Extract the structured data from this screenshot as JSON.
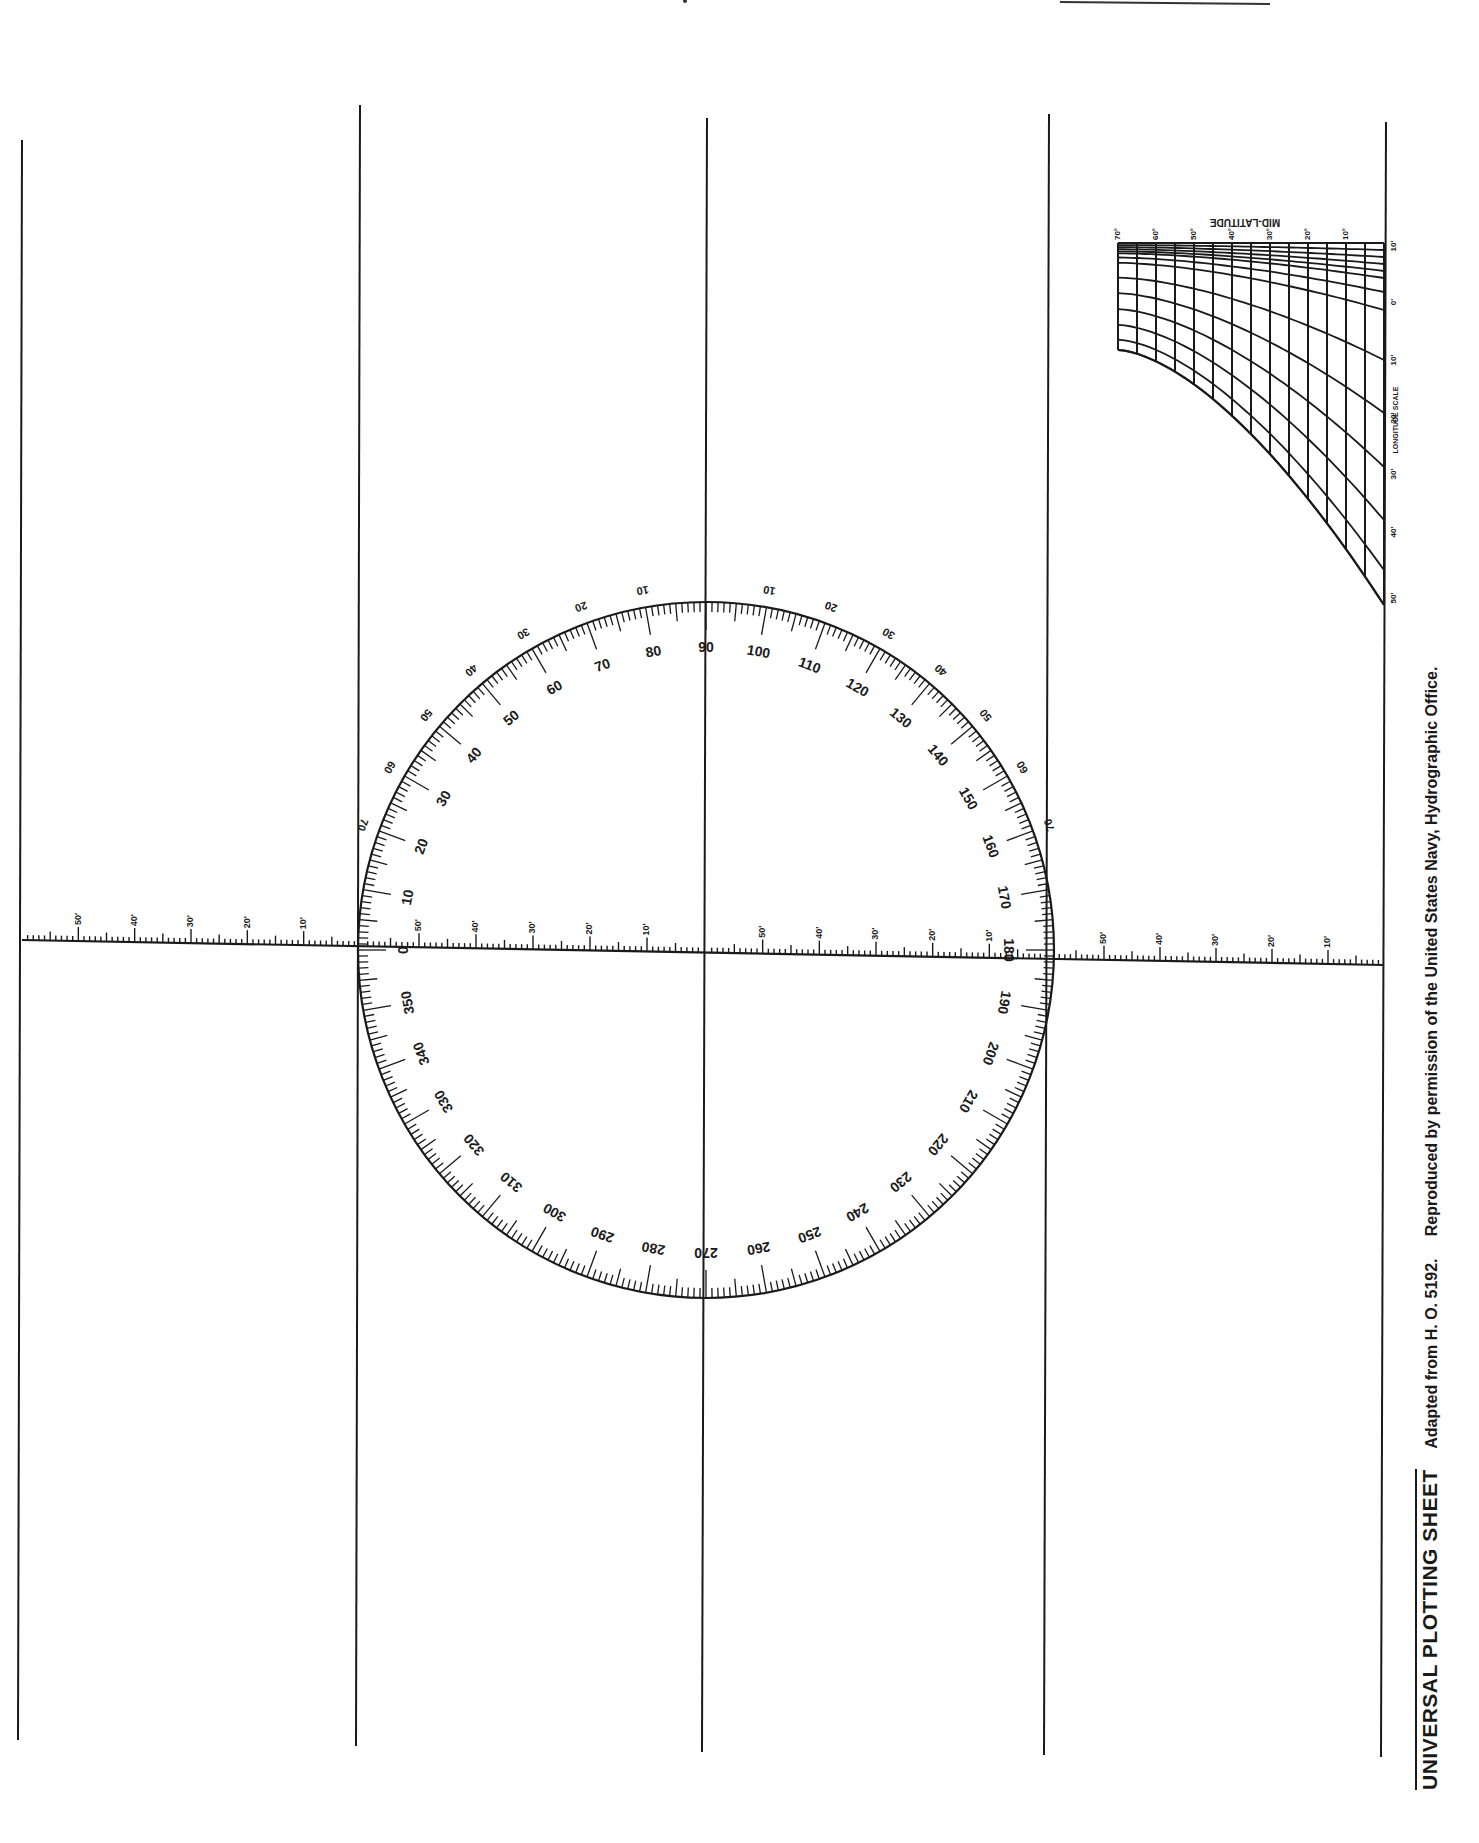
{
  "document": {
    "title": "UNIVERSAL PLOTTING SHEET",
    "credit_1": "Adapted from H. O. 5192.",
    "credit_2": "Reproduced by permission of the United States Navy, Hydrographic Office.",
    "orientation": "rotated 90 degrees counter-clockwise"
  },
  "colors": {
    "ink": "#1a1a1a",
    "paper": "#ffffff"
  },
  "meridians": [
    {
      "x1": 22,
      "y1": 140,
      "x2": 18,
      "y2": 1740
    },
    {
      "x1": 360,
      "y1": 105,
      "x2": 356,
      "y2": 1746
    },
    {
      "x1": 707,
      "y1": 118,
      "x2": 702,
      "y2": 1752
    },
    {
      "x1": 1049,
      "y1": 114,
      "x2": 1044,
      "y2": 1755
    },
    {
      "x1": 1386,
      "y1": 122,
      "x2": 1381,
      "y2": 1757
    }
  ],
  "centerline": {
    "x1": 22,
    "y1": 940,
    "x2": 1384,
    "y2": 965
  },
  "compass_rose": {
    "cx": 706,
    "cy": 950,
    "r": 348,
    "outer_labels": [
      "10",
      "20",
      "30",
      "40",
      "50",
      "60",
      "70",
      "80",
      "90",
      "100",
      "110",
      "120",
      "130",
      "140",
      "150",
      "160",
      "170",
      "180",
      "190",
      "200",
      "210",
      "220",
      "230",
      "240",
      "250",
      "260",
      "270",
      "280",
      "290",
      "300",
      "310",
      "320",
      "330",
      "340",
      "350",
      "0"
    ],
    "inner_angle_labels_upper_left": [
      "10",
      "20",
      "30",
      "40",
      "50",
      "60",
      "70"
    ],
    "inner_angle_labels_upper_right": [
      "10",
      "20",
      "30",
      "40",
      "50",
      "60",
      "70"
    ]
  },
  "centerline_scale": {
    "left_segment_labels": [
      "50'",
      "40'",
      "30'",
      "20'",
      "10'"
    ],
    "inner_left_labels": [
      "50'",
      "40'",
      "30'",
      "20'",
      "10'"
    ],
    "inner_right_labels": [
      "50'",
      "40'",
      "30'",
      "20'",
      "10'"
    ],
    "right_segment_labels": [
      "50'",
      "40'",
      "30'",
      "20'",
      "10'"
    ]
  },
  "mid_latitude_scale": {
    "title": "MID-LATITUDE",
    "axis_label": "LONGITUDE SCALE",
    "latitude_labels": [
      "10°",
      "20°",
      "30°",
      "40°",
      "50°",
      "60°",
      "70°"
    ],
    "longitude_labels": [
      "10'",
      "0'",
      "10'",
      "20'",
      "30'",
      "40'",
      "50'"
    ]
  }
}
